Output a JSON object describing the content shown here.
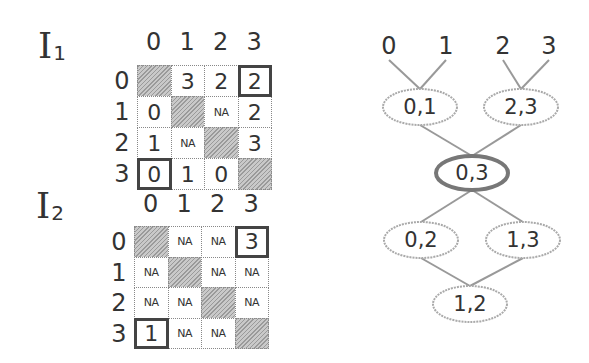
{
  "matrices": [
    {
      "name": "I",
      "subscript": "1",
      "col_headers": [
        "0",
        "1",
        "2",
        "3"
      ],
      "row_headers": [
        "0",
        "1",
        "2",
        "3"
      ],
      "cells": [
        [
          "",
          "3",
          "2",
          "2"
        ],
        [
          "0",
          "",
          "NA",
          "2"
        ],
        [
          "1",
          "NA",
          "",
          "3"
        ],
        [
          "0",
          "1",
          "0",
          ""
        ]
      ],
      "highlighted": [
        [
          0,
          3
        ],
        [
          3,
          0
        ]
      ]
    },
    {
      "name": "I",
      "subscript": "2",
      "col_headers": [
        "0",
        "1",
        "2",
        "3"
      ],
      "row_headers": [
        "0",
        "1",
        "2",
        "3"
      ],
      "cells": [
        [
          "",
          "NA",
          "NA",
          "3"
        ],
        [
          "NA",
          "",
          "NA",
          "NA"
        ],
        [
          "NA",
          "NA",
          "",
          "NA"
        ],
        [
          "1",
          "NA",
          "NA",
          ""
        ]
      ],
      "highlighted": [
        [
          0,
          3
        ],
        [
          3,
          0
        ]
      ]
    }
  ],
  "tree": {
    "leaves": [
      "0",
      "1",
      "2",
      "3"
    ],
    "nodes": [
      {
        "id": "n01",
        "label": "0,1"
      },
      {
        "id": "n23",
        "label": "2,3"
      },
      {
        "id": "n03",
        "label": "0,3",
        "emphasized": true
      },
      {
        "id": "n02",
        "label": "0,2"
      },
      {
        "id": "n13",
        "label": "1,3"
      },
      {
        "id": "n12",
        "label": "1,2"
      }
    ],
    "edges": [
      [
        "leaf0",
        "n01"
      ],
      [
        "leaf1",
        "n01"
      ],
      [
        "leaf2",
        "n23"
      ],
      [
        "leaf3",
        "n23"
      ],
      [
        "n01",
        "n03"
      ],
      [
        "n23",
        "n03"
      ],
      [
        "n03",
        "n02"
      ],
      [
        "n03",
        "n13"
      ],
      [
        "n02",
        "n12"
      ],
      [
        "n13",
        "n12"
      ]
    ]
  }
}
